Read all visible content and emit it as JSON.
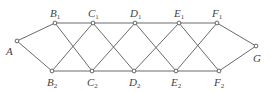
{
  "diagram": {
    "type": "graph",
    "colors": {
      "edge": "#6a6a6a",
      "node_stroke": "#555555",
      "label": "#444444"
    },
    "nodes": [
      {
        "id": "A",
        "letter": "A",
        "sub": ""
      },
      {
        "id": "B1",
        "letter": "B",
        "sub": "1"
      },
      {
        "id": "B2",
        "letter": "B",
        "sub": "2"
      },
      {
        "id": "C1",
        "letter": "C",
        "sub": "1"
      },
      {
        "id": "C2",
        "letter": "C",
        "sub": "2"
      },
      {
        "id": "D1",
        "letter": "D",
        "sub": "1"
      },
      {
        "id": "D2",
        "letter": "D",
        "sub": "2"
      },
      {
        "id": "E1",
        "letter": "E",
        "sub": "1"
      },
      {
        "id": "E2",
        "letter": "E",
        "sub": "2"
      },
      {
        "id": "F1",
        "letter": "F",
        "sub": "1"
      },
      {
        "id": "F2",
        "letter": "F",
        "sub": "2"
      },
      {
        "id": "G",
        "letter": "G",
        "sub": ""
      }
    ],
    "edges": [
      [
        "A",
        "B1"
      ],
      [
        "A",
        "B2"
      ],
      [
        "B1",
        "C1"
      ],
      [
        "C1",
        "D1"
      ],
      [
        "D1",
        "E1"
      ],
      [
        "E1",
        "F1"
      ],
      [
        "B2",
        "C2"
      ],
      [
        "C2",
        "D2"
      ],
      [
        "D2",
        "E2"
      ],
      [
        "E2",
        "F2"
      ],
      [
        "B1",
        "C2"
      ],
      [
        "B2",
        "C1"
      ],
      [
        "C1",
        "D2"
      ],
      [
        "C2",
        "D1"
      ],
      [
        "D1",
        "E2"
      ],
      [
        "D2",
        "E1"
      ],
      [
        "E1",
        "F2"
      ],
      [
        "E2",
        "F1"
      ],
      [
        "F1",
        "G"
      ],
      [
        "F2",
        "G"
      ]
    ]
  }
}
